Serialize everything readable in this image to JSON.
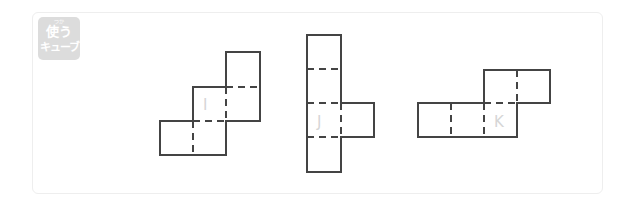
{
  "badge": {
    "ruby": "つか",
    "line1": "使う",
    "line2": "キューブ"
  },
  "nets": [
    {
      "label": "I"
    },
    {
      "label": "J"
    },
    {
      "label": "K"
    }
  ],
  "colors": {
    "line": "#444444",
    "label": "#d6d6d6",
    "badge": "#dcdcdc"
  }
}
